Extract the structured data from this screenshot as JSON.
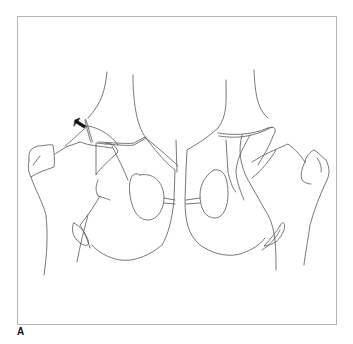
{
  "figure": {
    "panel_label": "A",
    "annotations": [
      {
        "type": "arrow-icon",
        "position": "left femoral head / acetabular rim",
        "color": "#111111"
      }
    ],
    "colors": {
      "line": "#555555",
      "frame_border": "#b5b5b5",
      "background": "#ffffff"
    }
  }
}
